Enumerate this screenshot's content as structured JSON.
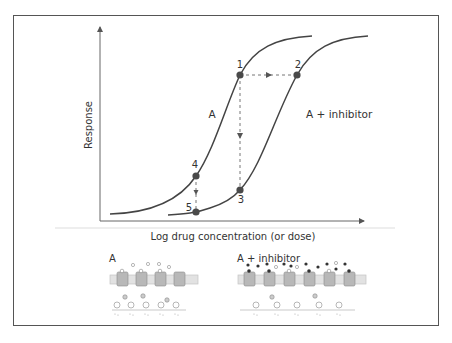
{
  "figure": {
    "type": "dose-response diagram",
    "y_axis_label": "Response",
    "x_axis_label": "Log drug concentration (or dose)"
  },
  "curves": [
    {
      "name": "A",
      "label": "A"
    },
    {
      "name": "A + inhibitor",
      "label": "A + inhibitor"
    }
  ],
  "points": [
    {
      "id": "1",
      "label": "1"
    },
    {
      "id": "2",
      "label": "2"
    },
    {
      "id": "3",
      "label": "3"
    },
    {
      "id": "4",
      "label": "4"
    },
    {
      "id": "5",
      "label": "5"
    }
  ],
  "panels": [
    {
      "title": "A"
    },
    {
      "title": "A + inhibitor"
    }
  ],
  "colors": {
    "curve": "#444444",
    "point": "#4a4a4a",
    "frame": "#555555",
    "receptor": "#b8b8b8",
    "membrane": "#d0d0d0"
  }
}
